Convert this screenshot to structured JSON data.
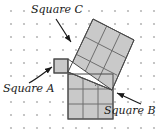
{
  "figure": {
    "type": "geometry-diagram",
    "background_color": "#ffffff",
    "dot_grid": {
      "color": "#b8b8b8",
      "spacing_px": 13,
      "origin_x": 11,
      "origin_y": 11,
      "cols": 12,
      "rows": 10,
      "dot_radius": 1.1
    },
    "shape_style": {
      "fill": "#c9c9c9",
      "stroke": "#4a4a4a",
      "inner_line": "#6e6e6e",
      "stroke_width": 1
    },
    "labels": [
      {
        "id": "square-c",
        "text": "Square C",
        "x": 31,
        "y": 13,
        "arrow_from_x": 56,
        "arrow_from_y": 19,
        "arrow_to_x": 72,
        "arrow_to_y": 44
      },
      {
        "id": "square-a",
        "text": "Square A",
        "x": 3,
        "y": 92,
        "arrow_from_x": 29,
        "arrow_from_y": 83,
        "arrow_to_x": 54,
        "arrow_to_y": 66
      },
      {
        "id": "square-b",
        "text": "Square B",
        "x": 104,
        "y": 114,
        "arrow_from_x": 141,
        "arrow_from_y": 104,
        "arrow_to_x": 114,
        "arrow_to_y": 92
      }
    ],
    "squares": {
      "square_a": {
        "name": "Square A",
        "subdivisions": 1,
        "x": 54,
        "y": 59,
        "size": 14
      },
      "square_b": {
        "name": "Square B",
        "subdivisions": 3,
        "x": 68,
        "y": 74,
        "size": 45
      },
      "square_c": {
        "name": "Square C",
        "subdivisions": 3,
        "rotation_deg": -19,
        "corners": [
          [
            68,
            72
          ],
          [
            93,
            19
          ],
          [
            134,
            40
          ],
          [
            112,
            90
          ]
        ]
      }
    },
    "triangle": {
      "name": "right-triangle",
      "corners": [
        [
          68,
          72
        ],
        [
          68,
          59
        ],
        [
          112,
          90
        ]
      ],
      "fill": "#ffffff"
    }
  }
}
